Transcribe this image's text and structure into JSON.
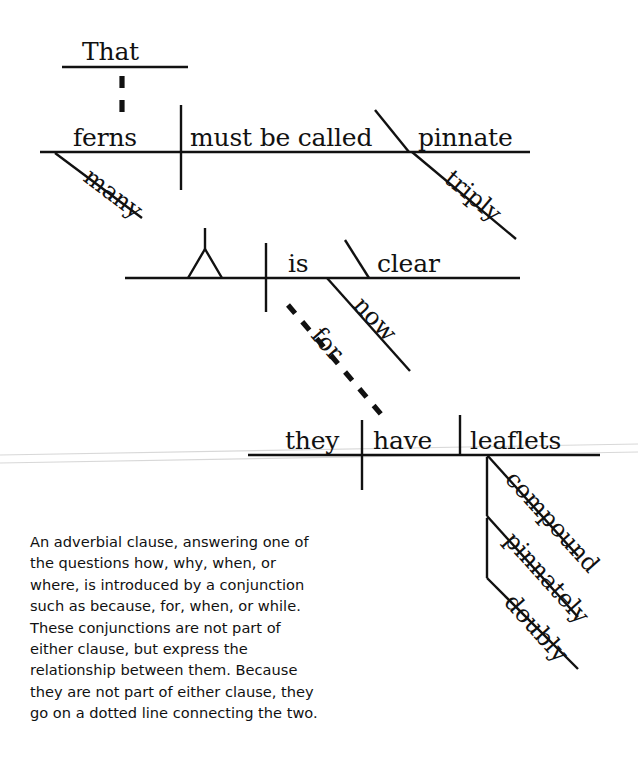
{
  "image": {
    "kind": "sentence-diagram",
    "title_text": "Reed-Kellogg sentence diagram",
    "background_color": "#ffffff",
    "ink_color": "#111111"
  },
  "diagram": {
    "sentence": "That ferns must be called triply pinnate is now clear, for they have doubly pinnately compound leaflets.",
    "clauses": [
      {
        "name": "noun-clause",
        "baseline_label": "top",
        "subject": "ferns",
        "predicate": "must be called",
        "complement": "pinnate",
        "modifiers": [
          {
            "word": "many",
            "attaches_to": "ferns",
            "style": "slant"
          },
          {
            "word": "triply",
            "attaches_to": "pinnate",
            "style": "slant"
          }
        ],
        "introducer": {
          "word": "That",
          "style": "pedestal-dashed"
        }
      },
      {
        "name": "main-clause",
        "baseline_label": "middle",
        "subject_placeholder": "triangle",
        "predicate": "is",
        "complement": "clear",
        "modifiers": [
          {
            "word": "now",
            "attaches_to": "is",
            "style": "slant"
          }
        ]
      },
      {
        "name": "adverbial-clause",
        "baseline_label": "bottom",
        "subject": "they",
        "predicate": "have",
        "object": "leaflets",
        "modifiers": [
          {
            "word": "compound",
            "attaches_to": "leaflets",
            "style": "slant"
          },
          {
            "word": "pinnately",
            "attaches_to": "compound",
            "style": "slant-drop"
          },
          {
            "word": "doubly",
            "attaches_to": "pinnately",
            "style": "slant-drop"
          }
        ]
      }
    ],
    "connector": {
      "word": "for",
      "style": "dotted-diagonal",
      "connects": "main-clause to adverbial-clause"
    }
  },
  "words": {
    "that": "That",
    "ferns": "ferns",
    "many": "many",
    "must_be_called": "must be called",
    "pinnate": "pinnate",
    "triply": "triply",
    "is": "is",
    "clear": "clear",
    "now": "now",
    "for": "for",
    "they": "they",
    "have": "have",
    "leaflets": "leaflets",
    "compound": "compound",
    "pinnately": "pinnately",
    "doubly": "doubly"
  },
  "caption": {
    "text": "An adverbial clause, answering one of the questions how, why, when, or where, is introduced by a conjunction such as because, for, when, or while. These conjunctions are not part of either clause, but express the relationship between them. Because they are not part of either clause, they go on a dotted line connecting the two."
  }
}
